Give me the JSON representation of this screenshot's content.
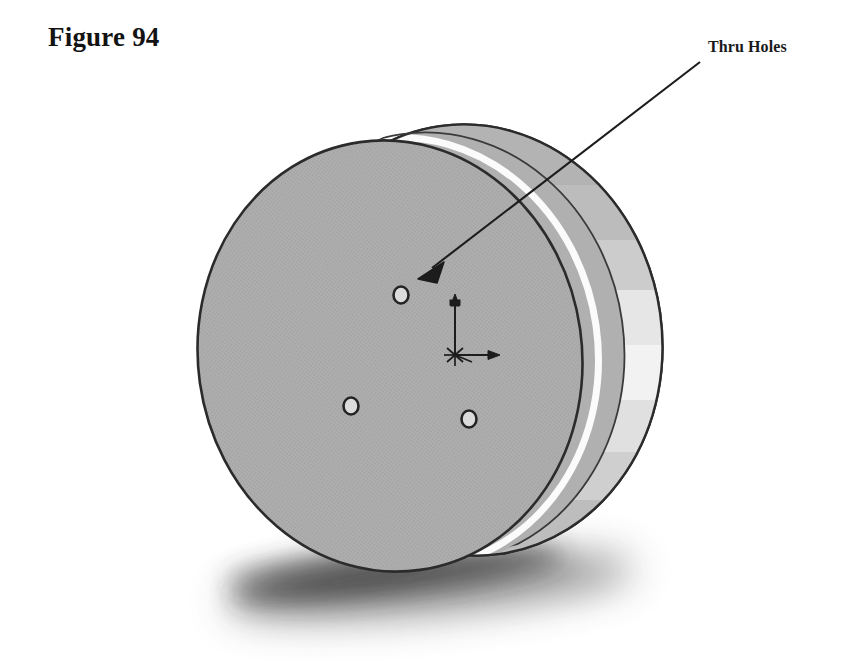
{
  "figure": {
    "caption": "Figure 94"
  },
  "annotation": {
    "label": "Thru Holes",
    "leader": {
      "start_x": 700,
      "start_y": 62,
      "tip_x": 418,
      "tip_y": 278
    }
  },
  "colors": {
    "background": "#ffffff",
    "outline": "#2b2b2b",
    "face_fill": "#a9a9a9",
    "face_fill_dark": "#9e9e9e",
    "rim_top": "#b2b2b2",
    "rim_mid": "#c9c9c9",
    "rim_bright": "#f2f2f2",
    "rim_light": "#e4e4e4",
    "rim_bottom": "#b8b8b8",
    "highlight": "#fbfbfb",
    "shadow": "#3a3a3a",
    "hole_fill": "#d8d8d8",
    "text": "#131313"
  },
  "model": {
    "description": "shaded isometric solid cylinder disc with three thru holes on front face",
    "face": {
      "cx": 390,
      "cy": 356,
      "rx": 192,
      "ry": 216,
      "rotation_deg": -8
    },
    "rim": {
      "cx": 470,
      "cy": 340,
      "rx": 192,
      "ry": 216,
      "rotation_deg": -8,
      "offset_x": 80,
      "offset_y": -16
    },
    "holes": [
      {
        "name": "thru-hole-upper",
        "cx": 401,
        "cy": 295,
        "rx": 8,
        "ry": 9
      },
      {
        "name": "thru-hole-lower-left",
        "cx": 351,
        "cy": 406,
        "rx": 8,
        "ry": 9
      },
      {
        "name": "thru-hole-lower-right",
        "cx": 469,
        "cy": 419,
        "rx": 8,
        "ry": 9
      }
    ],
    "origin_triad": {
      "origin_x": 455,
      "origin_y": 355,
      "y_axis_tip_x": 455,
      "y_axis_tip_y": 297,
      "x_axis_tip_x": 497,
      "x_axis_tip_y": 355
    },
    "ground_shadow": {
      "cx": 405,
      "cy": 582,
      "rx": 215,
      "ry": 32,
      "rotation_deg": -6
    }
  }
}
